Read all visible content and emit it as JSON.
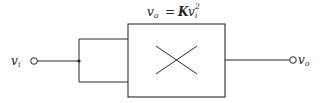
{
  "diagram": {
    "type": "block-diagram",
    "title_equation": {
      "lhs_var": "v",
      "lhs_sub": "o",
      "equals": "=",
      "const": "K",
      "rhs_var": "v",
      "rhs_sub": "i",
      "rhs_exp": "2",
      "full_text": "v_o = K v_i^2"
    },
    "input": {
      "label_var": "v",
      "label_sub": "i"
    },
    "output": {
      "label_var": "v",
      "label_sub": "o"
    },
    "block": {
      "symbol": "multiplier-x",
      "description": "Multiplier with both inputs tied to v_i (squarer)"
    },
    "colors": {
      "line": "#2a2a2a",
      "text": "#222222",
      "background": "#ffffff"
    }
  }
}
